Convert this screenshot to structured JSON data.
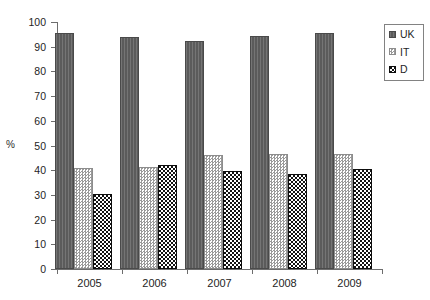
{
  "chart_data": {
    "type": "bar",
    "title": "",
    "xlabel": "",
    "ylabel": "%",
    "ylim": [
      0,
      100
    ],
    "ytick_step": 10,
    "yticks": [
      0,
      10,
      20,
      30,
      40,
      50,
      60,
      70,
      80,
      90,
      100
    ],
    "grid": false,
    "legend_position": "top-right",
    "categories": [
      "2005",
      "2006",
      "2007",
      "2008",
      "2009"
    ],
    "series": [
      {
        "name": "UK",
        "pattern": "solid-gray",
        "color": "#5b5b5b",
        "values": [
          95.5,
          94.0,
          92.5,
          94.5,
          95.5
        ]
      },
      {
        "name": "IT",
        "pattern": "light-checker",
        "color": "#9a9a9a",
        "values": [
          41.0,
          41.5,
          46.0,
          46.5,
          46.5
        ]
      },
      {
        "name": "D",
        "pattern": "dark-checker",
        "color": "#121212",
        "values": [
          30.5,
          42.0,
          39.5,
          38.5,
          40.5
        ]
      }
    ]
  },
  "legend": {
    "entries": [
      {
        "label": "UK"
      },
      {
        "label": "IT"
      },
      {
        "label": "D"
      }
    ]
  }
}
